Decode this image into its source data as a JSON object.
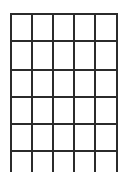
{
  "grid": {
    "columns": 5,
    "rows": 5,
    "vertical_lines_x": [
      11,
      32,
      53,
      74,
      95,
      117
    ],
    "horizontal_lines_y": [
      14,
      41,
      70,
      97,
      124,
      151
    ],
    "line_top": 14,
    "line_bottom": 172,
    "line_color": "#2b2b2b",
    "line_width": 2
  }
}
